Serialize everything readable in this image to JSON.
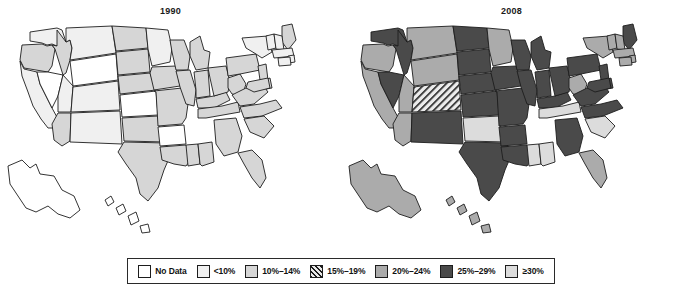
{
  "figure": {
    "type": "choropleth-map-pair",
    "panels": [
      {
        "id": "1990",
        "title": "1990"
      },
      {
        "id": "2008",
        "title": "2008"
      }
    ]
  },
  "legend": {
    "items": [
      {
        "label": "No Data",
        "key": "no-data",
        "color": "#ffffff",
        "pattern": "solid"
      },
      {
        "label": "<10%",
        "key": "lt10",
        "color": "#f0f0f0",
        "pattern": "solid"
      },
      {
        "label": "10%–14%",
        "key": "10-14",
        "color": "#d6d6d6",
        "pattern": "solid"
      },
      {
        "label": "15%–19%",
        "key": "15-19",
        "color": "#e8e8e8",
        "pattern": "hatch"
      },
      {
        "label": "20%–24%",
        "key": "20-24",
        "color": "#ababab",
        "pattern": "solid"
      },
      {
        "label": "25%–29%",
        "key": "25-29",
        "color": "#4a4a4a",
        "pattern": "solid"
      },
      {
        "label": "≥30%",
        "key": "ge30",
        "color": "#dcdcdc",
        "pattern": "solid"
      }
    ]
  },
  "chart_data": {
    "type": "map",
    "maps": [
      {
        "year": "1990"
      },
      {
        "year": "2008"
      }
    ],
    "categories": [
      "No Data",
      "<10%",
      "10%–14%",
      "15%–19%",
      "20%–24%",
      "25%–29%",
      "≥30%"
    ],
    "states_1990": {
      "AL": "10-14",
      "AK": "no-data",
      "AZ": "10-14",
      "AR": "no-data",
      "CA": "lt10",
      "CO": "lt10",
      "CT": "lt10",
      "DE": "10-14",
      "FL": "10-14",
      "GA": "10-14",
      "HI": "no-data",
      "ID": "10-14",
      "IL": "10-14",
      "IN": "10-14",
      "IA": "10-14",
      "KS": "no-data",
      "KY": "10-14",
      "LA": "10-14",
      "ME": "10-14",
      "MD": "10-14",
      "MA": "lt10",
      "MI": "10-14",
      "MN": "lt10",
      "MS": "10-14",
      "MO": "10-14",
      "MT": "lt10",
      "NE": "10-14",
      "NV": "no-data",
      "NH": "lt10",
      "NJ": "10-14",
      "NM": "lt10",
      "NY": "lt10",
      "NC": "10-14",
      "ND": "10-14",
      "OH": "10-14",
      "OK": "10-14",
      "OR": "10-14",
      "PA": "10-14",
      "RI": "lt10",
      "SC": "10-14",
      "SD": "10-14",
      "TN": "10-14",
      "TX": "10-14",
      "UT": "lt10",
      "VT": "lt10",
      "VA": "10-14",
      "WA": "lt10",
      "WV": "10-14",
      "WI": "10-14",
      "WY": "no-data"
    },
    "states_2008": {
      "AL": "ge30",
      "AK": "20-24",
      "AZ": "20-24",
      "AR": "25-29",
      "CA": "20-24",
      "CO": "15-19",
      "CT": "20-24",
      "DE": "25-29",
      "FL": "20-24",
      "GA": "25-29",
      "HI": "20-24",
      "ID": "25-29",
      "IL": "25-29",
      "IN": "25-29",
      "IA": "25-29",
      "KS": "25-29",
      "KY": "25-29",
      "LA": "25-29",
      "ME": "25-29",
      "MD": "25-29",
      "MA": "20-24",
      "MI": "25-29",
      "MN": "20-24",
      "MS": "ge30",
      "MO": "25-29",
      "MT": "20-24",
      "NE": "25-29",
      "NV": "25-29",
      "NH": "20-24",
      "NJ": "25-29",
      "NM": "25-29",
      "NY": "20-24",
      "NC": "25-29",
      "ND": "25-29",
      "OH": "25-29",
      "OK": "ge30",
      "OR": "20-24",
      "PA": "25-29",
      "RI": "20-24",
      "SC": "ge30",
      "SD": "25-29",
      "TN": "ge30",
      "TX": "25-29",
      "UT": "20-24",
      "VT": "20-24",
      "VA": "25-29",
      "WA": "25-29",
      "WV": "20-24",
      "WI": "25-29",
      "WY": "20-24"
    }
  }
}
